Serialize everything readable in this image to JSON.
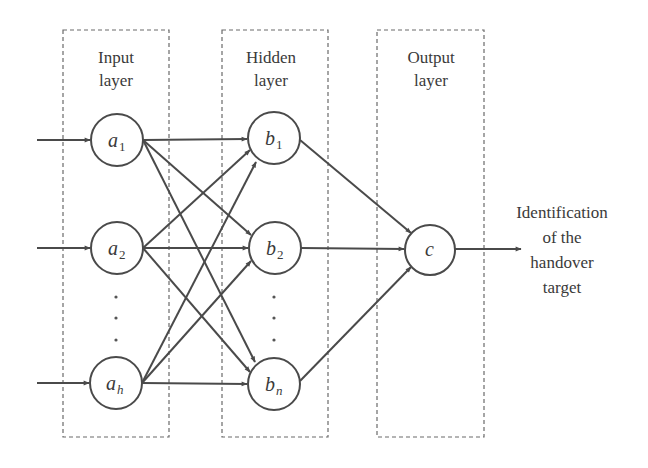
{
  "layers": [
    {
      "id": "input",
      "title_line1": "Input",
      "title_line2": "layer",
      "box": {
        "x": 63,
        "y": 30,
        "w": 106,
        "h": 407
      }
    },
    {
      "id": "hidden",
      "title_line1": "Hidden",
      "title_line2": "layer",
      "box": {
        "x": 222,
        "y": 30,
        "w": 106,
        "h": 407
      }
    },
    {
      "id": "output",
      "title_line1": "Output",
      "title_line2": "layer",
      "box": {
        "x": 377,
        "y": 30,
        "w": 107,
        "h": 407
      }
    }
  ],
  "nodes": {
    "a1": {
      "base": "a",
      "sub": "1",
      "sub_italic": false,
      "cx": 117,
      "cy": 140,
      "r": 26
    },
    "a2": {
      "base": "a",
      "sub": "2",
      "sub_italic": false,
      "cx": 117,
      "cy": 248,
      "r": 26
    },
    "ah": {
      "base": "a",
      "sub": "h",
      "sub_italic": true,
      "cx": 116,
      "cy": 383,
      "r": 26
    },
    "b1": {
      "base": "b",
      "sub": "1",
      "sub_italic": false,
      "cx": 274,
      "cy": 138,
      "r": 26
    },
    "b2": {
      "base": "b",
      "sub": "2",
      "sub_italic": false,
      "cx": 275,
      "cy": 248,
      "r": 26
    },
    "bn": {
      "base": "b",
      "sub": "n",
      "sub_italic": true,
      "cx": 274,
      "cy": 384,
      "r": 26
    },
    "c": {
      "base": "c",
      "sub": "",
      "sub_italic": false,
      "cx": 430,
      "cy": 250,
      "r": 25
    }
  },
  "ellipsis_dots": {
    "input": [
      {
        "x": 116,
        "y": 297
      },
      {
        "x": 116,
        "y": 318
      },
      {
        "x": 116,
        "y": 340
      }
    ],
    "hidden": [
      {
        "x": 274,
        "y": 297
      },
      {
        "x": 274,
        "y": 318
      },
      {
        "x": 274,
        "y": 340
      }
    ]
  },
  "edges": [
    {
      "from": "input",
      "to": "a1"
    },
    {
      "from": "input",
      "to": "a2"
    },
    {
      "from": "input",
      "to": "ah"
    },
    {
      "from": "a1",
      "to": "b1"
    },
    {
      "from": "a1",
      "to": "b2"
    },
    {
      "from": "a1",
      "to": "bn"
    },
    {
      "from": "a2",
      "to": "b1"
    },
    {
      "from": "a2",
      "to": "b2"
    },
    {
      "from": "a2",
      "to": "bn"
    },
    {
      "from": "ah",
      "to": "b1"
    },
    {
      "from": "ah",
      "to": "b2"
    },
    {
      "from": "ah",
      "to": "bn"
    },
    {
      "from": "b1",
      "to": "c"
    },
    {
      "from": "b2",
      "to": "c"
    },
    {
      "from": "bn",
      "to": "c"
    },
    {
      "from": "c",
      "to": "output"
    }
  ],
  "output_label": {
    "lines": [
      "Identification",
      "of the",
      "handover",
      "target"
    ]
  },
  "colors": {
    "line": "#4a4a4a",
    "box": "#6a6a6a",
    "text": "#3a3a3a"
  }
}
